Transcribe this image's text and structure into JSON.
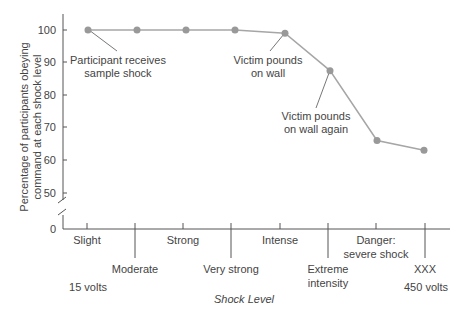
{
  "chart_data": {
    "type": "line",
    "title": "",
    "xlabel": "Shock Level",
    "ylabel": "Percentage of participants obeying command at each shock level",
    "ylabel_lines": [
      "Percentage of participants obeying",
      "command at each shock level"
    ],
    "y_ticks": [
      "0",
      "50",
      "60",
      "70",
      "80",
      "90",
      "100"
    ],
    "ylim": [
      0,
      100
    ],
    "y_axis_break": true,
    "grid": false,
    "legend": null,
    "categories_top": [
      "Slight",
      "Strong",
      "Intense",
      "Danger: severe shock"
    ],
    "categories_bottom": [
      "Moderate",
      "Very strong",
      "Extreme intensity",
      "XXX"
    ],
    "voltage_labels": {
      "start": "15 volts",
      "end": "450 volts"
    },
    "x": [
      1,
      2,
      3,
      4,
      5,
      6,
      7,
      8
    ],
    "values": [
      100,
      100,
      100,
      100,
      99,
      87.5,
      66,
      63
    ],
    "annotations": [
      {
        "text": "Participant receives sample shock",
        "point_index": 0
      },
      {
        "text": "Victim pounds on wall",
        "point_index": 4
      },
      {
        "text": "Victim pounds on wall again",
        "point_index": 5
      }
    ],
    "colors": {
      "line": "#a6a6a6",
      "marker": "#999999",
      "axis": "#555555",
      "text": "#444444"
    }
  }
}
